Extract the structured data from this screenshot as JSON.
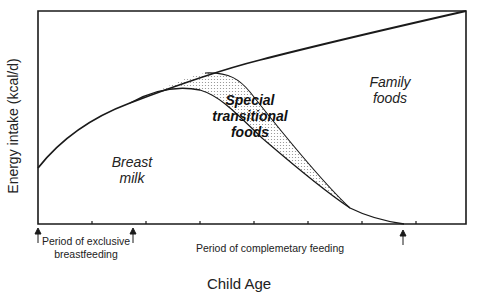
{
  "diagram": {
    "y_axis_label": "Energy intake (kcal/d)",
    "x_axis_label": "Child Age",
    "regions": {
      "breast_milk": [
        "Breast",
        "milk"
      ],
      "transitional": [
        "Special",
        "transitional",
        "foods"
      ],
      "family": [
        "Family",
        "foods"
      ]
    },
    "periods": {
      "exclusive": [
        "Period of exclusive",
        "breastfeeding"
      ],
      "complementary": "Period of complemetary feeding"
    },
    "tick_count": 7,
    "colors": {
      "line": "#1a1a1a",
      "shade": "#8a8a8a",
      "background": "#ffffff"
    }
  }
}
